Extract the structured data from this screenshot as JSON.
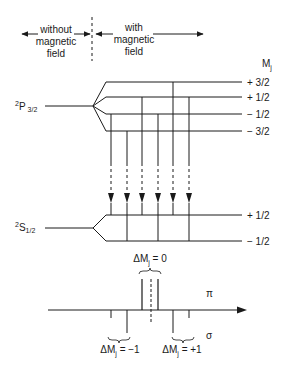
{
  "header": {
    "left_label": [
      "without",
      "magnetic",
      "field"
    ],
    "right_label": [
      "with",
      "magnetic",
      "field"
    ]
  },
  "mj_label": {
    "main": "M",
    "sub": "j"
  },
  "upper_state": {
    "label": {
      "sup": "2",
      "main": "P",
      "sub": "3/2"
    },
    "origin": {
      "x": 93,
      "y": 106
    },
    "stem_start_x": 45,
    "fan_end_x": 106,
    "line_end_x": 242,
    "levels": [
      {
        "mj": "+ 3/2",
        "y": 82
      },
      {
        "mj": "+ 1/2",
        "y": 97
      },
      {
        "mj": "− 1/2",
        "y": 114
      },
      {
        "mj": "− 3/2",
        "y": 131
      }
    ]
  },
  "lower_state": {
    "label": {
      "sup": "2",
      "main": "S",
      "sub": "1/2"
    },
    "origin": {
      "x": 93,
      "y": 228
    },
    "stem_start_x": 45,
    "fan_end_x": 106,
    "line_end_x": 242,
    "levels": [
      {
        "mj": "+ 1/2",
        "y": 215
      },
      {
        "mj": "− 1/2",
        "y": 241
      }
    ]
  },
  "transitions": [
    {
      "x": 111,
      "from_y": 114,
      "to_y": 215
    },
    {
      "x": 127,
      "from_y": 131,
      "to_y": 241
    },
    {
      "x": 142,
      "from_y": 97,
      "to_y": 215
    },
    {
      "x": 158,
      "from_y": 114,
      "to_y": 241
    },
    {
      "x": 173,
      "from_y": 82,
      "to_y": 215
    },
    {
      "x": 189,
      "from_y": 97,
      "to_y": 241
    }
  ],
  "transition_dash": {
    "solid_end_y": 163,
    "arrow_tip_y": 203
  },
  "spectrum": {
    "axis_y": 310,
    "axis_x_start": 48,
    "axis_x_end": 247,
    "center_x": 151,
    "pi_label": "π",
    "sigma_label": "σ",
    "pi_lines": [
      {
        "x": 142,
        "top": 279
      },
      {
        "x": 158,
        "top": 279
      }
    ],
    "sigma_lines": [
      {
        "x": 111,
        "bottom": 318
      },
      {
        "x": 127,
        "bottom": 333
      },
      {
        "x": 173,
        "bottom": 333
      },
      {
        "x": 189,
        "bottom": 318
      }
    ],
    "labels": {
      "dm0": {
        "pre": "ΔM",
        "sub": "j",
        "post": " = 0"
      },
      "dm_minus": {
        "pre": "ΔM",
        "sub": "j",
        "post": " = −1"
      },
      "dm_plus": {
        "pre": "ΔM",
        "sub": "j",
        "post": " = +1"
      }
    }
  },
  "colors": {
    "ink": "#1a1a1a",
    "background": "#ffffff"
  }
}
